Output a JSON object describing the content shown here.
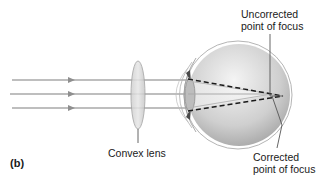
{
  "figure": {
    "panel_label": "(b)",
    "labels": {
      "uncorrected_focus": "Uncorrected\npoint of focus",
      "convex_lens": "Convex lens",
      "corrected_focus": "Corrected\npoint of focus"
    },
    "rays": {
      "count": 3,
      "y_positions": [
        80,
        95,
        108
      ],
      "color": "#a9a9a9",
      "arrow_color": "#8f8f8f"
    },
    "colors": {
      "eyeball_light": "#f2f2f2",
      "eyeball_dark": "#9d9d9d",
      "lens_fill": "#d6d6d6",
      "outline": "#9a9a9a",
      "dashed_ray": "#1a1a1a",
      "leader_line": "#555555"
    }
  }
}
